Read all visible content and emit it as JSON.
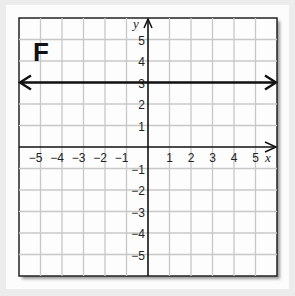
{
  "chart_data": {
    "type": "line",
    "title": "F",
    "xlabel": "x",
    "ylabel": "y",
    "xlim": [
      -6,
      6
    ],
    "ylim": [
      -6,
      6
    ],
    "grid": true,
    "x_ticks": [
      "-5",
      "-4",
      "-3",
      "-2",
      "-1",
      "1",
      "2",
      "3",
      "4",
      "5"
    ],
    "y_ticks": [
      "5",
      "4",
      "3",
      "2",
      "1",
      "-1",
      "-2",
      "-3",
      "-4",
      "-5"
    ],
    "series": [
      {
        "name": "y = 3",
        "equation": "y = 3",
        "x": [
          -6,
          6
        ],
        "values": [
          3,
          3
        ],
        "arrows": "both",
        "color": "#111111"
      }
    ]
  },
  "panel_label": "F",
  "axis_labels": {
    "x": "x",
    "y": "y"
  },
  "colors": {
    "grid": "#c8c8c8",
    "axis": "#111111",
    "line": "#111111",
    "background": "#fcfcfc"
  }
}
